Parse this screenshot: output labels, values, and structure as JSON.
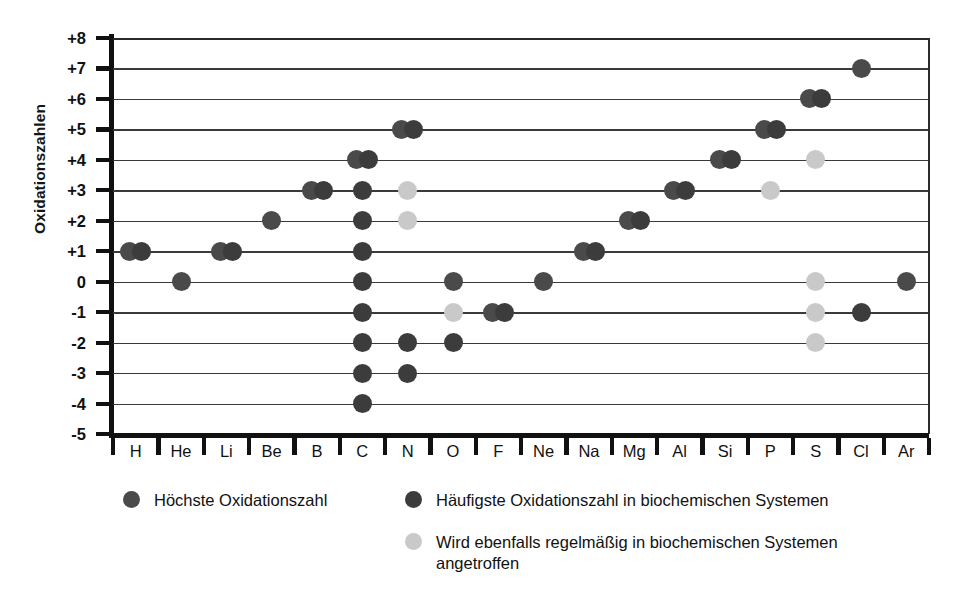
{
  "chart_data": {
    "type": "scatter",
    "title": "",
    "xlabel": "",
    "ylabel": "Oxidationszahlen",
    "grid": true,
    "legend_position": "below-plot",
    "ylim": [
      -5,
      8
    ],
    "yticks": [
      "+8",
      "+7",
      "+6",
      "+5",
      "+4",
      "+3",
      "+2",
      "+1",
      "0",
      "-1",
      "-2",
      "-3",
      "-4",
      "-5"
    ],
    "ytick_values": [
      8,
      7,
      6,
      5,
      4,
      3,
      2,
      1,
      0,
      -1,
      -2,
      -3,
      -4,
      -5
    ],
    "categories": [
      "H",
      "He",
      "Li",
      "Be",
      "B",
      "C",
      "N",
      "O",
      "F",
      "Ne",
      "Na",
      "Mg",
      "Al",
      "Si",
      "P",
      "S",
      "Cl",
      "Ar"
    ],
    "series": [
      {
        "name": "Höchste Oxidationszahl",
        "key": "highest",
        "color": "#4a4a4a",
        "points": [
          {
            "element": "H",
            "value": 1
          },
          {
            "element": "He",
            "value": 0
          },
          {
            "element": "Li",
            "value": 1
          },
          {
            "element": "Be",
            "value": 2
          },
          {
            "element": "B",
            "value": 3
          },
          {
            "element": "C",
            "value": 4
          },
          {
            "element": "N",
            "value": 5
          },
          {
            "element": "O",
            "value": 0
          },
          {
            "element": "F",
            "value": -1
          },
          {
            "element": "Ne",
            "value": 0
          },
          {
            "element": "Na",
            "value": 1
          },
          {
            "element": "Mg",
            "value": 2
          },
          {
            "element": "Al",
            "value": 3
          },
          {
            "element": "Si",
            "value": 4
          },
          {
            "element": "P",
            "value": 5
          },
          {
            "element": "S",
            "value": 6
          },
          {
            "element": "Cl",
            "value": 7
          },
          {
            "element": "Ar",
            "value": 0
          }
        ]
      },
      {
        "name": "Häufigste Oxidationszahl in biochemischen Systemen",
        "key": "frequent",
        "color": "#3c3c3c",
        "points": [
          {
            "element": "H",
            "value": 1
          },
          {
            "element": "Li",
            "value": 1
          },
          {
            "element": "B",
            "value": 3
          },
          {
            "element": "C",
            "value": 4
          },
          {
            "element": "C",
            "value": 3
          },
          {
            "element": "C",
            "value": 2
          },
          {
            "element": "C",
            "value": 1
          },
          {
            "element": "C",
            "value": 0
          },
          {
            "element": "C",
            "value": -1
          },
          {
            "element": "C",
            "value": -2
          },
          {
            "element": "C",
            "value": -3
          },
          {
            "element": "C",
            "value": -4
          },
          {
            "element": "N",
            "value": 5
          },
          {
            "element": "N",
            "value": -2
          },
          {
            "element": "N",
            "value": -3
          },
          {
            "element": "O",
            "value": -2
          },
          {
            "element": "F",
            "value": -1
          },
          {
            "element": "Na",
            "value": 1
          },
          {
            "element": "Mg",
            "value": 2
          },
          {
            "element": "Al",
            "value": 3
          },
          {
            "element": "Si",
            "value": 4
          },
          {
            "element": "P",
            "value": 5
          },
          {
            "element": "S",
            "value": 6
          },
          {
            "element": "Cl",
            "value": -1
          }
        ]
      },
      {
        "name": "Wird ebenfalls regelmäßig in biochemischen Systemen angetroffen",
        "key": "alsofound",
        "color": "#c9c9c9",
        "points": [
          {
            "element": "N",
            "value": 3
          },
          {
            "element": "N",
            "value": 2
          },
          {
            "element": "O",
            "value": -1
          },
          {
            "element": "P",
            "value": 3
          },
          {
            "element": "S",
            "value": 4
          },
          {
            "element": "S",
            "value": 0
          },
          {
            "element": "S",
            "value": -1
          },
          {
            "element": "S",
            "value": -2
          }
        ]
      }
    ]
  },
  "legend": {
    "entries": [
      {
        "label": "Höchste Oxidationszahl",
        "key": "highest"
      },
      {
        "label": "Häufigste Oxidationszahl in biochemischen Systemen",
        "key": "frequent"
      },
      {
        "label": "Wird ebenfalls regelmäßig in biochemischen Systemen\nangetroffen",
        "key": "alsofound"
      }
    ]
  }
}
